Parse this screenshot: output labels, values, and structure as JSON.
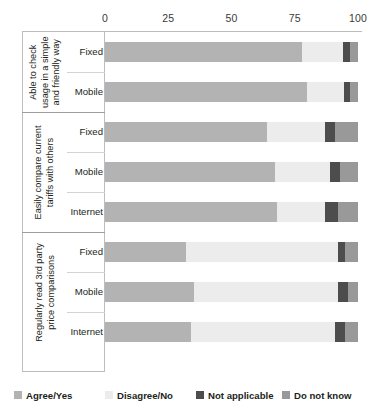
{
  "chart_data": {
    "type": "bar",
    "orientation": "horizontal",
    "stacked": true,
    "percent": true,
    "title": "",
    "subtitle": "",
    "xlabel": "",
    "ylabel": "",
    "xlim": [
      0,
      100
    ],
    "xticks": [
      0,
      25,
      50,
      75,
      100
    ],
    "xtick_labels": [
      "0",
      "25",
      "50",
      "75",
      "100"
    ],
    "grid": false,
    "legend_position": "bottom",
    "legend": [
      "Agree/Yes",
      "Disagree/No",
      "Not applicable",
      "Do not know"
    ],
    "series_colors": [
      "#b3b3b3",
      "#ececec",
      "#4d4d4d",
      "#999999"
    ],
    "series": [
      {
        "name": "Agree/Yes",
        "values": [
          78,
          80,
          64,
          67,
          68,
          32,
          35,
          34
        ]
      },
      {
        "name": "Disagree/No",
        "values": [
          16,
          14.5,
          23,
          22,
          19,
          60,
          57,
          57
        ]
      },
      {
        "name": "Not applicable",
        "values": [
          3,
          2.5,
          4,
          4,
          5,
          3,
          4,
          4
        ]
      },
      {
        "name": "Do not know",
        "values": [
          3,
          3,
          9,
          7,
          8,
          5,
          4,
          5
        ]
      }
    ],
    "categories": [
      "Able to check usage in a simple and friendly way - Fixed",
      "Able to check usage in a simple and friendly way - Mobile",
      "Easily compare current tariffs with others - Fixed",
      "Easily compare current tariffs with others - Mobile",
      "Easily compare current tariffs with others - Internet",
      "Regularly read 3rd party price comparisons - Fixed",
      "Regularly read 3rd party price comparisons - Mobile",
      "Regularly read 3rd party price comparisons - Internet"
    ],
    "groups": [
      {
        "title_lines": [
          "Able to check",
          "usage in a simple",
          "and friendly way"
        ],
        "rows": [
          {
            "label": "Fixed",
            "values": [
              78,
              16,
              3,
              3
            ]
          },
          {
            "label": "Mobile",
            "values": [
              80,
              14.5,
              2.5,
              3
            ]
          }
        ]
      },
      {
        "title_lines": [
          "Easily compare current",
          "tariffs with others"
        ],
        "rows": [
          {
            "label": "Fixed",
            "values": [
              64,
              23,
              4,
              9
            ]
          },
          {
            "label": "Mobile",
            "values": [
              67,
              22,
              4,
              7
            ]
          },
          {
            "label": "Internet",
            "values": [
              68,
              19,
              5,
              8
            ]
          }
        ]
      },
      {
        "title_lines": [
          "Regularly read 3rd party",
          "price comparisons"
        ],
        "rows": [
          {
            "label": "Fixed",
            "values": [
              32,
              60,
              3,
              5
            ]
          },
          {
            "label": "Mobile",
            "values": [
              35,
              57,
              4,
              4
            ]
          },
          {
            "label": "Internet",
            "values": [
              34,
              57,
              4,
              5
            ]
          }
        ]
      }
    ]
  },
  "axis": {
    "ticks": [
      {
        "label": "0"
      },
      {
        "label": "25"
      },
      {
        "label": "50"
      },
      {
        "label": "75"
      },
      {
        "label": "100"
      }
    ]
  },
  "legend": {
    "items": [
      {
        "label": "Agree/Yes",
        "color": "#b3b3b3"
      },
      {
        "label": "Disagree/No",
        "color": "#ececec"
      },
      {
        "label": "Not applicable",
        "color": "#4d4d4d"
      },
      {
        "label": "Do not know",
        "color": "#999999"
      }
    ]
  }
}
